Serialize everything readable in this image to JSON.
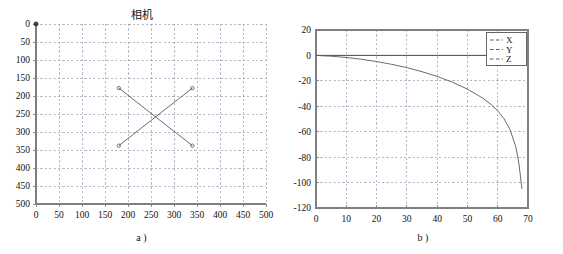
{
  "figure": {
    "background": "#ffffff",
    "axis_color": "#808080",
    "grid_color": "#9a9ab0",
    "curve_color": "#5a5a5a"
  },
  "panels": [
    {
      "id": "a",
      "caption": "a )",
      "chart_data": {
        "type": "line",
        "title": "相机",
        "xlabel": "",
        "ylabel": "",
        "xlim": [
          0,
          500
        ],
        "ylim": [
          0,
          500
        ],
        "y_inverted": true,
        "grid": true,
        "legend": null,
        "xticks": [
          0,
          50,
          100,
          150,
          200,
          250,
          300,
          350,
          400,
          450,
          500
        ],
        "yticks": [
          0,
          50,
          100,
          150,
          200,
          250,
          300,
          350,
          400,
          450,
          500
        ],
        "xtick_labels": [
          "0",
          "50",
          "100",
          "150",
          "200",
          "250",
          "300",
          "350",
          "400",
          "450",
          "500"
        ],
        "ytick_labels": [
          "0",
          "50",
          "100",
          "150",
          "200",
          "250",
          "300",
          "350",
          "400",
          "450",
          "500"
        ],
        "markers": "circle",
        "series": [
          {
            "name": "diagonal-1",
            "x": [
              180,
              340
            ],
            "y": [
              178,
              338
            ]
          },
          {
            "name": "diagonal-2",
            "x": [
              180,
              340
            ],
            "y": [
              338,
              178
            ]
          },
          {
            "name": "origin-point",
            "x": [
              0
            ],
            "y": [
              0
            ]
          }
        ],
        "annotations": [
          "crossing lines intersect near (255, 252)"
        ]
      }
    },
    {
      "id": "b",
      "caption": "b )",
      "chart_data": {
        "type": "line",
        "title": "",
        "xlabel": "",
        "ylabel": "",
        "xlim": [
          0,
          70
        ],
        "ylim": [
          -120,
          20
        ],
        "grid": true,
        "legend": {
          "position": "top-right",
          "entries": [
            "X",
            "Y",
            "Z"
          ]
        },
        "xticks": [
          0,
          10,
          20,
          30,
          40,
          50,
          60,
          70
        ],
        "yticks": [
          20,
          0,
          -20,
          -40,
          -60,
          -80,
          -100,
          -120
        ],
        "xtick_labels": [
          "0",
          "10",
          "20",
          "30",
          "40",
          "50",
          "60",
          "70"
        ],
        "ytick_labels": [
          "20",
          "0",
          "-20",
          "-40",
          "-60",
          "-80",
          "-100",
          "-120"
        ],
        "series": [
          {
            "name": "X",
            "x": [
              0,
              10,
              20,
              30,
              40,
              50,
              60,
              68
            ],
            "y": [
              0,
              0,
              0,
              0,
              0,
              0,
              0,
              0
            ]
          },
          {
            "name": "Y",
            "x": [
              0,
              10,
              20,
              30,
              40,
              50,
              60,
              68
            ],
            "y": [
              0,
              0,
              0,
              0,
              0,
              0,
              0,
              0
            ]
          },
          {
            "name": "Z",
            "x": [
              0,
              5,
              10,
              15,
              20,
              25,
              30,
              35,
              40,
              45,
              50,
              55,
              58,
              60,
              62,
              64,
              66,
              67,
              68
            ],
            "y": [
              0,
              -0.6,
              -1.6,
              -3.0,
              -4.8,
              -7.0,
              -9.6,
              -12.8,
              -16.5,
              -21.0,
              -26.5,
              -33.5,
              -39.0,
              -43.5,
              -49.5,
              -58.0,
              -72.0,
              -85.0,
              -105.0
            ]
          }
        ]
      }
    }
  ]
}
